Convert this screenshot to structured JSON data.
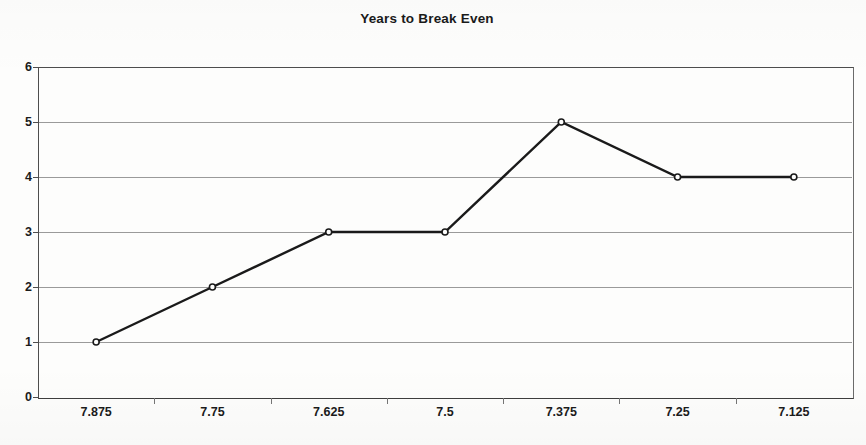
{
  "chart_data": {
    "type": "line",
    "title": "Years to Break Even",
    "xlabel": "",
    "ylabel": "",
    "categories": [
      "7.875",
      "7.75",
      "7.625",
      "7.5",
      "7.375",
      "7.25",
      "7.125"
    ],
    "values": [
      1,
      2,
      3,
      3,
      5,
      4,
      4
    ],
    "ylim": [
      0,
      6
    ],
    "y_ticks": [
      "0",
      "1",
      "2",
      "3",
      "4",
      "5",
      "6"
    ],
    "grid": "horizontal",
    "legend": "none",
    "series": [
      {
        "name": "Years to Break Even",
        "values": [
          1,
          2,
          3,
          3,
          5,
          4,
          4
        ],
        "line_color": "#1a1a1a",
        "marker": "open-circle"
      }
    ],
    "colors": {
      "line": "#1a1a1a",
      "grid": "#9a9a9a",
      "axis": "#4d4d4d",
      "text": "#1b1b1b",
      "background": "#fdfdfc"
    }
  }
}
